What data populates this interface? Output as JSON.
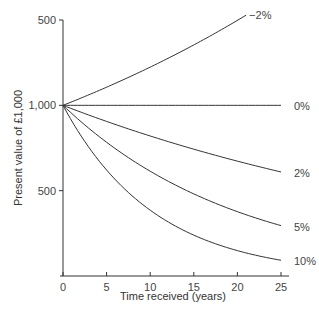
{
  "chart_data": {
    "type": "line",
    "title": "",
    "xlabel": "Time received (years)",
    "ylabel": "Present value of £1,000",
    "xlim": [
      0,
      25
    ],
    "ylim": [
      0,
      1500
    ],
    "x_ticks": [
      0,
      5,
      10,
      15,
      20,
      25
    ],
    "x_tick_labels": [
      "0",
      "5",
      "10",
      "15",
      "20",
      "25"
    ],
    "y_ticks": [
      500,
      1000,
      1500
    ],
    "y_tick_labels": [
      "500",
      "1,000",
      "500"
    ],
    "grid": false,
    "legend": "inline-right",
    "series": [
      {
        "name": "−2%",
        "rate": -0.02,
        "x": [
          0,
          3,
          6,
          9,
          12,
          15,
          18,
          21
        ],
        "values": [
          1000,
          1063,
          1129,
          1200,
          1275,
          1355,
          1439,
          1529
        ]
      },
      {
        "name": "0%",
        "rate": 0.0,
        "x": [
          0,
          5,
          10,
          15,
          20,
          25
        ],
        "values": [
          1000,
          1000,
          1000,
          1000,
          1000,
          1000
        ]
      },
      {
        "name": "2%",
        "rate": 0.02,
        "x": [
          0,
          5,
          10,
          15,
          20,
          25
        ],
        "values": [
          1000,
          906,
          820,
          743,
          673,
          610
        ]
      },
      {
        "name": "5%",
        "rate": 0.05,
        "x": [
          0,
          5,
          10,
          15,
          20,
          25
        ],
        "values": [
          1000,
          784,
          614,
          481,
          377,
          295
        ]
      },
      {
        "name": "10%",
        "rate": 0.1,
        "x": [
          0,
          5,
          10,
          15,
          20,
          25
        ],
        "values": [
          1000,
          621,
          386,
          239,
          149,
          92
        ]
      }
    ]
  }
}
